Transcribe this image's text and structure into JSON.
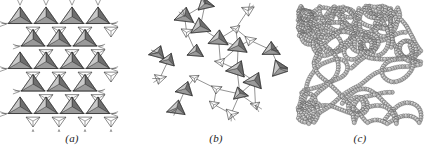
{
  "figure": {
    "width": 432,
    "height": 158,
    "background_color": "#ffffff",
    "kind": "scientific-illustration",
    "panel_count": 3
  },
  "style": {
    "tetra_face_dark": "#6e6e6e",
    "tetra_face_mid": "#9a9a9a",
    "tetra_face_light": "#c9c9c9",
    "tetra_face_white": "#ffffff",
    "stroke_color": "#2a2a2a",
    "bond_color": "#3a3a3a",
    "sphere_fill": "#b4b4b4",
    "sphere_highlight": "#e2e2e2",
    "sphere_stroke": "#3c3c3c",
    "caption_color": "#1b1b1b"
  },
  "panels": [
    {
      "id": "a",
      "caption": "(a)",
      "description": "Ordered crystalline hexagonal sheet of corner-linked SiO4 tetrahedra viewed along the c axis",
      "art_name": "crystalline-tetrahedral-sheet",
      "ordering": "crystalline",
      "motif": "hexagonal-ring-lattice",
      "geometry": {
        "cell_width": 26,
        "cell_height": 22.5,
        "rows": 5,
        "columns": 4,
        "origin_x": 20,
        "origin_y": 18,
        "up_triangle_size": 13.5,
        "down_triangle_size": 8.0,
        "apex_stub_length": 7
      }
    },
    {
      "id": "b",
      "caption": "(b)",
      "description": "Disordered amorphous network of the same corner-linked tetrahedra with irregular ring sizes",
      "art_name": "amorphous-tetrahedral-network",
      "ordering": "amorphous",
      "motif": "irregular-ring-network",
      "geometry": {
        "jitter_amplitude": 5.5,
        "rotation_spread_deg": 46,
        "ring_sizes": [
          5,
          6,
          7,
          8
        ],
        "node_count": 26
      }
    },
    {
      "id": "c",
      "caption": "(c)",
      "description": "Space-filling model of a random coiled chain network built from overlapping spheres",
      "art_name": "sphere-chain-random-network",
      "ordering": "amorphous",
      "motif": "random-coil-chains",
      "geometry": {
        "sphere_radius": 2.1,
        "sphere_spacing": 2.6,
        "chain_count": 17,
        "bounds": {
          "x": 8,
          "y": 4,
          "width": 128,
          "height": 122
        }
      }
    }
  ],
  "captions": {
    "a": "(a)",
    "b": "(b)",
    "c": "(c)"
  }
}
